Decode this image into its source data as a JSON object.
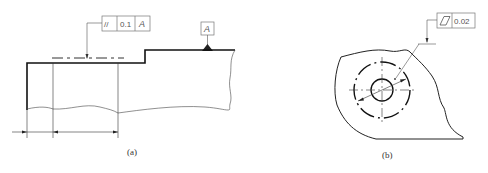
{
  "figure_a": {
    "caption": "(a)",
    "feature_control_frame": {
      "symbol": "//",
      "symbol_name": "parallelism",
      "tolerance": "0.1",
      "datum": "A"
    },
    "datum_label": "A"
  },
  "figure_b": {
    "caption": "(b)",
    "feature_control_frame": {
      "symbol": "⏥",
      "symbol_name": "flatness",
      "tolerance": "0.02"
    }
  },
  "colors": {
    "line": "#222222",
    "thin_line": "#333333",
    "frame": "#777777",
    "text": "#555555"
  }
}
